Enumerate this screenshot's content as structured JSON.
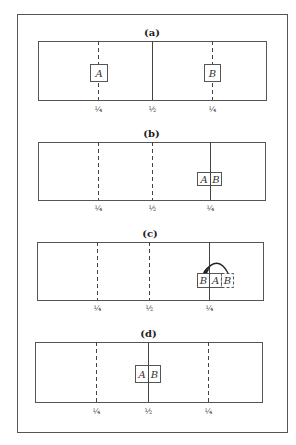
{
  "figure": {
    "outer_frame": {
      "x": 17,
      "y": 14,
      "w": 270,
      "h": 418
    },
    "stroke_color": "#555555",
    "line_color": "#444444"
  },
  "panels": [
    {
      "id": "a",
      "label": "(a)",
      "label_y": 36,
      "box": {
        "x": 38,
        "y": 41,
        "w": 228,
        "h": 59
      },
      "lines": [
        {
          "x": 98,
          "style": "dashed"
        },
        {
          "x": 152,
          "style": "solid"
        },
        {
          "x": 212,
          "style": "dashed"
        }
      ],
      "ticks": [
        {
          "x": 98,
          "label": "¼"
        },
        {
          "x": 152,
          "label": "½"
        },
        {
          "x": 212,
          "label": "¼"
        }
      ],
      "tick_y": 112,
      "blocks": [
        {
          "text": "A",
          "x": 90,
          "y": 64,
          "w": 17,
          "h": 17,
          "style": "solid"
        },
        {
          "text": "B",
          "x": 204,
          "y": 64,
          "w": 16,
          "h": 17,
          "style": "solid"
        }
      ]
    },
    {
      "id": "b",
      "label": "(b)",
      "label_y": 137,
      "box": {
        "x": 38,
        "y": 142,
        "w": 227,
        "h": 58
      },
      "lines": [
        {
          "x": 98,
          "style": "dashed"
        },
        {
          "x": 152,
          "style": "dashed"
        },
        {
          "x": 210,
          "style": "solid"
        }
      ],
      "ticks": [
        {
          "x": 98,
          "label": "¼"
        },
        {
          "x": 152,
          "label": "½"
        },
        {
          "x": 210,
          "label": "¼"
        }
      ],
      "tick_y": 211,
      "blocks": [
        {
          "text": "A",
          "x": 197,
          "y": 172,
          "w": 13,
          "h": 13,
          "style": "solid"
        },
        {
          "text": "B",
          "x": 210,
          "y": 172,
          "w": 11,
          "h": 13,
          "style": "solid"
        }
      ]
    },
    {
      "id": "c",
      "label": "(c)",
      "label_y": 237,
      "box": {
        "x": 37,
        "y": 242,
        "w": 226,
        "h": 58
      },
      "lines": [
        {
          "x": 97,
          "style": "dashed"
        },
        {
          "x": 149,
          "style": "dashed"
        },
        {
          "x": 209,
          "style": "solid"
        }
      ],
      "ticks": [
        {
          "x": 97,
          "label": "¼"
        },
        {
          "x": 149,
          "label": "½"
        },
        {
          "x": 209,
          "label": "¼"
        }
      ],
      "tick_y": 311,
      "blocks": [
        {
          "text": "B",
          "x": 197,
          "y": 273,
          "w": 12,
          "h": 14,
          "style": "solid"
        },
        {
          "text": "A",
          "x": 209,
          "y": 273,
          "w": 12,
          "h": 14,
          "style": "solid"
        },
        {
          "text": "B",
          "x": 221,
          "y": 273,
          "w": 12,
          "h": 14,
          "style": "dashed"
        }
      ],
      "arrow": {
        "from_x": 228,
        "from_y": 273,
        "to_x": 204,
        "to_y": 272,
        "ctrl_x": 218,
        "ctrl_y": 254,
        "description": "curved arrow from dashed B to new B position"
      }
    },
    {
      "id": "d",
      "label": "(d)",
      "label_y": 337,
      "box": {
        "x": 35,
        "y": 342,
        "w": 227,
        "h": 60
      },
      "lines": [
        {
          "x": 96,
          "style": "dashed"
        },
        {
          "x": 148,
          "style": "solid"
        },
        {
          "x": 208,
          "style": "dashed"
        }
      ],
      "ticks": [
        {
          "x": 96,
          "label": "¼"
        },
        {
          "x": 148,
          "label": "½"
        },
        {
          "x": 208,
          "label": "¼"
        }
      ],
      "tick_y": 414,
      "blocks": [
        {
          "text": "A",
          "x": 135,
          "y": 365,
          "w": 13,
          "h": 17,
          "style": "solid"
        },
        {
          "text": "B",
          "x": 148,
          "y": 365,
          "w": 12,
          "h": 17,
          "style": "solid"
        }
      ]
    }
  ]
}
